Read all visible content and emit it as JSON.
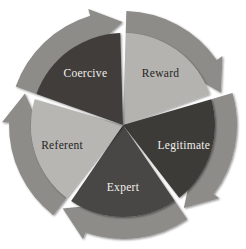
{
  "diagram": {
    "name": "bases-of-power-wheel",
    "type": "cyclic-pie-with-arrows",
    "direction": "clockwise",
    "background": "#ffffff",
    "segment_count": 5,
    "segments": [
      {
        "id": "reward",
        "label": "Reward",
        "order": 1,
        "tone": "light",
        "wedge_color": "#b4b3b0",
        "arrow_color": "#8d8c89",
        "label_color": "#27241f",
        "start_angle": 0,
        "end_angle": 72,
        "label_angle": 36,
        "label_radius": 64
      },
      {
        "id": "legitimate",
        "label": "Legitimate",
        "order": 2,
        "tone": "dark",
        "wedge_color": "#3c3b39",
        "arrow_color": "#8d8c89",
        "label_color": "#f2f0ec",
        "start_angle": 72,
        "end_angle": 144,
        "label_angle": 108,
        "label_radius": 64
      },
      {
        "id": "expert",
        "label": "Expert",
        "order": 3,
        "tone": "dark",
        "wedge_color": "#484744",
        "arrow_color": "#8d8c89",
        "label_color": "#f2f0ec",
        "start_angle": 144,
        "end_angle": 216,
        "label_angle": 180,
        "label_radius": 62
      },
      {
        "id": "referent",
        "label": "Referent",
        "order": 4,
        "tone": "light",
        "wedge_color": "#b7b6b3",
        "arrow_color": "#8d8c89",
        "label_color": "#27241f",
        "start_angle": 216,
        "end_angle": 288,
        "label_angle": 252,
        "label_radius": 64
      },
      {
        "id": "coercive",
        "label": "Coercive",
        "order": 5,
        "tone": "dark",
        "wedge_color": "#3f3e3b",
        "arrow_color": "#8d8c89",
        "label_color": "#f2f0ec",
        "start_angle": 288,
        "end_angle": 360,
        "label_angle": 324,
        "label_radius": 64
      }
    ],
    "geometry": {
      "center_x": 123,
      "center_y": 125,
      "outer_radius": 114,
      "ring_inner_radius": 92,
      "wedge_radius": 92,
      "gap_degrees": 3.4
    }
  }
}
